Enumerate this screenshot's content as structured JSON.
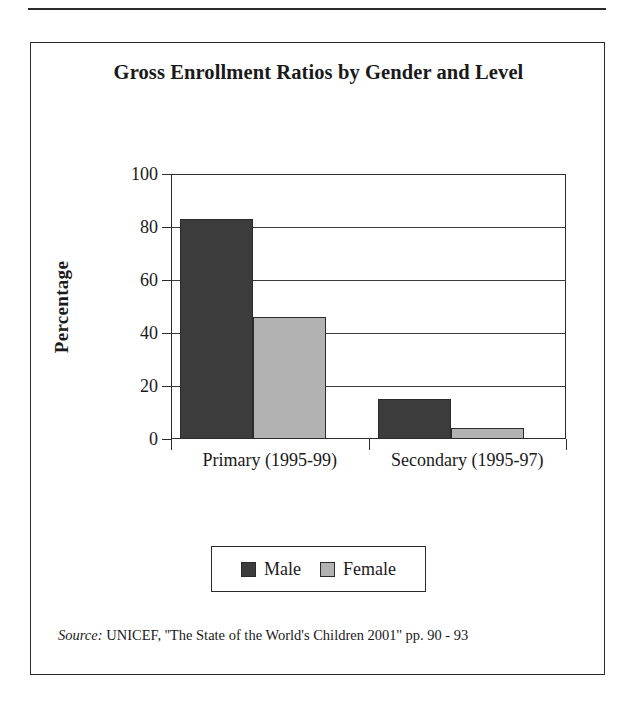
{
  "figure": {
    "title": "Gross Enrollment Ratios by Gender and Level",
    "source_label": "Source:",
    "source_text": " UNICEF, ''The State of the World's Children 2001'' pp. 90 - 93"
  },
  "legend": {
    "entries": [
      {
        "label": "Male",
        "color": "#3c3c3c"
      },
      {
        "label": "Female",
        "color": "#b2b2b2"
      }
    ]
  },
  "axis": {
    "y_title": "Percentage",
    "y_ticks": [
      "0",
      "20",
      "40",
      "60",
      "80",
      "100"
    ]
  },
  "chart_data": {
    "type": "bar",
    "title": "Gross Enrollment Ratios by Gender and Level",
    "xlabel": "",
    "ylabel": "Percentage",
    "ylim": [
      0,
      100
    ],
    "yticks": [
      0,
      20,
      40,
      60,
      80,
      100
    ],
    "grid": true,
    "legend_position": "bottom",
    "categories": [
      "Primary (1995-99)",
      "Secondary (1995-97)"
    ],
    "series": [
      {
        "name": "Male",
        "color": "#3c3c3c",
        "values": [
          83,
          15
        ]
      },
      {
        "name": "Female",
        "color": "#b2b2b2",
        "values": [
          46,
          4
        ]
      }
    ],
    "source": "Source: UNICEF, ''The State of the World's Children 2001'' pp. 90 - 93"
  }
}
